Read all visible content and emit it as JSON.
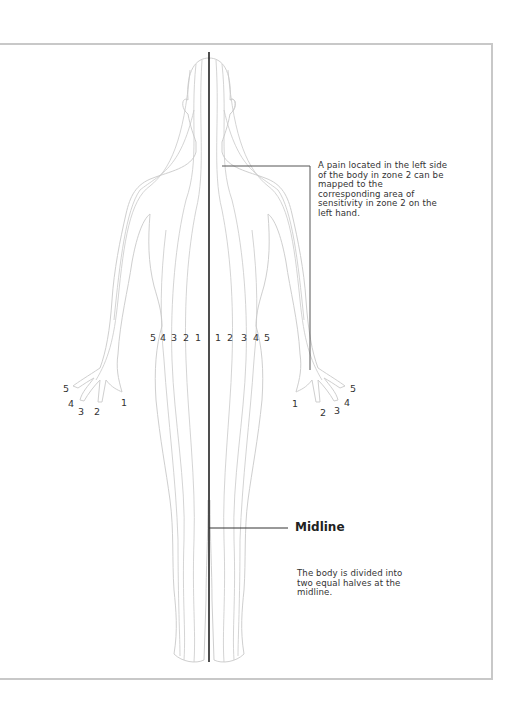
{
  "diagram": {
    "callout_zone2": "A pain located in the left side of the body in zone 2 can be mapped to the corresponding area of sensitivity in zone 2 on the left hand.",
    "midline_label": "Midline",
    "midline_note": "The body is divided into two equal halves at the midline.",
    "body_zone_labels_right_side": [
      "5",
      "4",
      "3",
      "2",
      "1"
    ],
    "body_zone_labels_left_side": [
      "1",
      "2",
      "3",
      "4",
      "5"
    ],
    "right_hand_finger_labels": {
      "f1": "1",
      "f2": "2",
      "f3": "3",
      "f4": "4",
      "f5": "5"
    },
    "left_hand_finger_labels": {
      "f1": "1",
      "f2": "2",
      "f3": "3",
      "f4": "4",
      "f5": "5"
    },
    "colors": {
      "outline": "#cfcfcf",
      "zone_lines": "#c4c4c4",
      "midline": "#222222",
      "callout_line": "#555555",
      "frame": "#c8c8c8",
      "text": "#333333"
    }
  }
}
